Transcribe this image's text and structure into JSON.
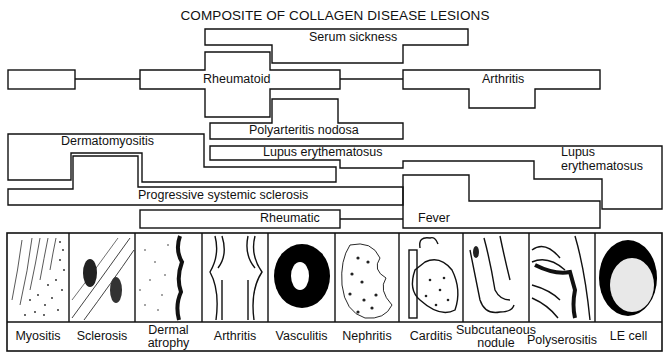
{
  "title": "COMPOSITE OF COLLAGEN DISEASE LESIONS",
  "diseases": {
    "serum_sickness": "Serum sickness",
    "rheumatoid": "Rheumatoid",
    "arthritis": "Arthritis",
    "polyarteritis_nodosa": "Polyarteritis nodosa",
    "dermatomyositis": "Dermatomyositis",
    "lupus_erythematosus_left": "Lupus erythematosus",
    "lupus_erythematosus_right_line1": "Lupus",
    "lupus_erythematosus_right_line2": "erythematosus",
    "progressive_systemic_sclerosis": "Progressive systemic sclerosis",
    "rheumatic": "Rheumatic",
    "fever": "Fever"
  },
  "lesions": [
    {
      "label": "Myositis"
    },
    {
      "label": "Sclerosis"
    },
    {
      "label_line1": "Dermal",
      "label_line2": "atrophy"
    },
    {
      "label": "Arthritis"
    },
    {
      "label": "Vasculitis"
    },
    {
      "label": "Nephritis"
    },
    {
      "label": "Carditis"
    },
    {
      "label_line1": "Subcutaneous",
      "label_line2": "nodule"
    },
    {
      "label": "Polyserositis"
    },
    {
      "label": "LE cell"
    }
  ]
}
